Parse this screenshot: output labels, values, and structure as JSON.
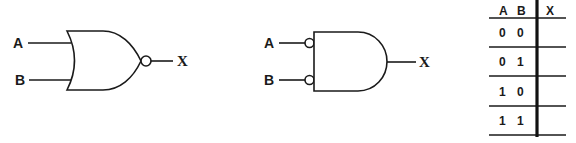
{
  "diagram": {
    "nor_gate": {
      "inputs": [
        "A",
        "B"
      ],
      "output": "X",
      "type": "NOR"
    },
    "and_inverted_inputs_gate": {
      "inputs": [
        "A",
        "B"
      ],
      "output": "X",
      "type": "AND with inverted inputs"
    },
    "truth_table": {
      "headers": [
        "A",
        "B",
        "X"
      ],
      "rows": [
        {
          "a": "0",
          "b": "0",
          "x": ""
        },
        {
          "a": "0",
          "b": "1",
          "x": ""
        },
        {
          "a": "1",
          "b": "0",
          "x": ""
        },
        {
          "a": "1",
          "b": "1",
          "x": ""
        }
      ]
    }
  },
  "colors": {
    "ink": "#1a1a1a",
    "background": "#ffffff"
  }
}
